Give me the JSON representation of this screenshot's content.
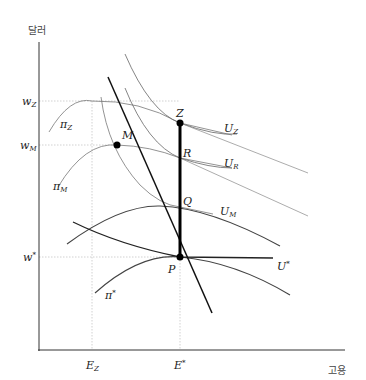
{
  "axes": {
    "y_label": "달러",
    "x_label": "고용"
  },
  "y_ticks": [
    {
      "base": "w",
      "sub": "Z",
      "sup": ""
    },
    {
      "base": "w",
      "sub": "M",
      "sup": ""
    },
    {
      "base": "w",
      "sub": "",
      "sup": "*"
    }
  ],
  "x_ticks": [
    {
      "base": "E",
      "sub": "Z",
      "sup": ""
    },
    {
      "base": "E",
      "sub": "",
      "sup": "*"
    }
  ],
  "points": {
    "Z": "Z",
    "R": "R",
    "Q": "Q",
    "P": "P",
    "M": "M"
  },
  "utility_curves": [
    {
      "base": "U",
      "sub": "Z",
      "sup": ""
    },
    {
      "base": "U",
      "sub": "R",
      "sup": ""
    },
    {
      "base": "U",
      "sub": "M",
      "sup": ""
    },
    {
      "base": "U",
      "sub": "",
      "sup": "*"
    }
  ],
  "profit_curves": [
    {
      "base": "π",
      "sub": "Z",
      "sup": ""
    },
    {
      "base": "π",
      "sub": "M",
      "sup": ""
    },
    {
      "base": "π",
      "sub": "",
      "sup": "*"
    }
  ],
  "colors": {
    "axis": "#333333",
    "thick_line": "#111111",
    "thin_curve": "#555555",
    "medium_curve": "#333333",
    "guide": "#bbbbbb"
  }
}
